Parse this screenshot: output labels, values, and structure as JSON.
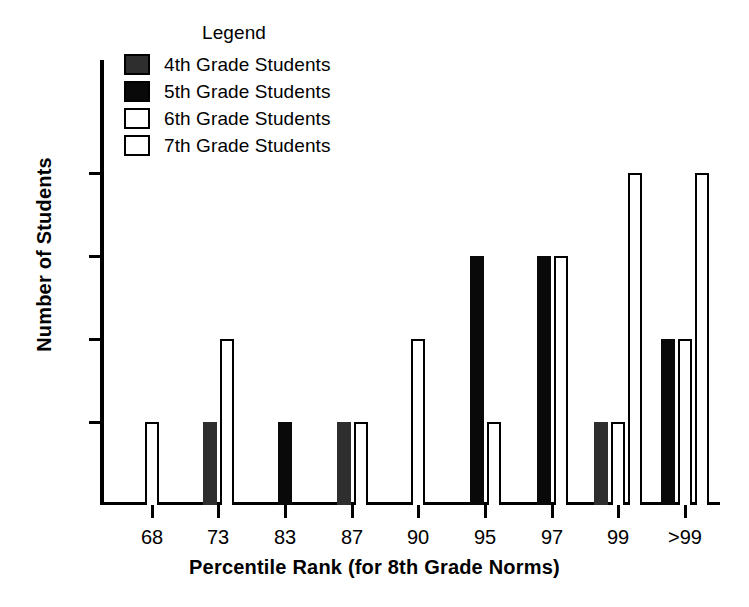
{
  "legend": {
    "title": "Legend",
    "entries": [
      {
        "label": "4th Grade Students",
        "key": "g4",
        "color": "#2e2e2e",
        "style": "filled-dark-gray"
      },
      {
        "label": "5th Grade Students",
        "key": "g5",
        "color": "#090909",
        "style": "filled-black"
      },
      {
        "label": "6th Grade Students",
        "key": "g6",
        "color": "#ffffff",
        "style": "outlined-white"
      },
      {
        "label": "7th Grade Students",
        "key": "g7",
        "color": "#ffffff",
        "style": "outlined-white"
      }
    ]
  },
  "axes": {
    "x_title": "Percentile Rank (for 8th Grade Norms)",
    "y_title": "Number of Students",
    "y_ticks": [
      "0",
      "1",
      "2",
      "3",
      "4"
    ],
    "x_ticks": [
      "68",
      "73",
      "83",
      "87",
      "90",
      "95",
      "97",
      "99",
      ">99"
    ]
  },
  "chart_data": {
    "type": "bar",
    "title": "",
    "xlabel": "Percentile Rank (for 8th Grade Norms)",
    "ylabel": "Number of Students",
    "categories": [
      "68",
      "73",
      "83",
      "87",
      "90",
      "95",
      "97",
      "99",
      ">99"
    ],
    "ylim": [
      0,
      4
    ],
    "yticks": [
      0,
      1,
      2,
      3,
      4
    ],
    "grid": false,
    "legend_position": "top-center",
    "series": [
      {
        "name": "4th Grade Students",
        "color": "#2e2e2e",
        "values": [
          0,
          1,
          0,
          1,
          0,
          0,
          0,
          1,
          0
        ]
      },
      {
        "name": "5th Grade Students",
        "color": "#090909",
        "values": [
          0,
          0,
          1,
          0,
          0,
          3,
          3,
          0,
          2
        ]
      },
      {
        "name": "6th Grade Students",
        "color": "#ffffff",
        "values": [
          0,
          2,
          0,
          0,
          2,
          1,
          3,
          1,
          2
        ]
      },
      {
        "name": "7th Grade Students",
        "color": "#ffffff",
        "values": [
          1,
          0,
          0,
          1,
          0,
          0,
          0,
          4,
          4
        ]
      }
    ]
  },
  "geometry": {
    "plot_left": 100,
    "plot_top": 60,
    "plot_width": 620,
    "plot_height": 445,
    "unit_px": 83,
    "bar_width": 14,
    "bar_gap": 3,
    "tick_x": [
      52,
      118,
      185,
      252,
      318,
      385,
      452,
      518,
      585
    ]
  }
}
